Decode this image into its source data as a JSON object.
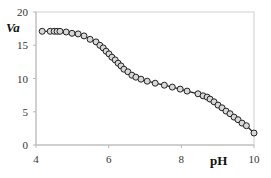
{
  "chart_data": {
    "type": "line",
    "title": "",
    "xlabel": "pH",
    "ylabel": "Va",
    "xlim": [
      4,
      10
    ],
    "ylim": [
      0,
      20
    ],
    "xticks": [
      4,
      6,
      8,
      10
    ],
    "yticks": [
      0,
      5,
      10,
      15,
      20
    ],
    "grid": false,
    "legend": null,
    "marker": "open-circle",
    "series": [
      {
        "name": "Va",
        "color": "#222222",
        "x": [
          4.17,
          4.39,
          4.5,
          4.58,
          4.66,
          4.83,
          4.99,
          5.16,
          5.32,
          5.49,
          5.65,
          5.76,
          5.85,
          5.93,
          6.01,
          6.09,
          6.18,
          6.26,
          6.34,
          6.42,
          6.53,
          6.64,
          6.75,
          6.89,
          7.06,
          7.28,
          7.53,
          7.75,
          7.97,
          8.16,
          8.46,
          8.6,
          8.71,
          8.79,
          8.9,
          9.01,
          9.12,
          9.23,
          9.34,
          9.45,
          9.56,
          9.67,
          9.79,
          10.0
        ],
        "y": [
          17.1,
          17.1,
          17.1,
          17.1,
          17.1,
          17.0,
          16.8,
          16.7,
          16.4,
          15.9,
          15.5,
          15.0,
          14.6,
          14.1,
          13.7,
          13.2,
          12.8,
          12.3,
          11.9,
          11.4,
          11.0,
          10.5,
          10.2,
          9.9,
          9.6,
          9.3,
          9.0,
          8.7,
          8.4,
          8.1,
          7.7,
          7.4,
          7.2,
          6.9,
          6.5,
          6.0,
          5.6,
          5.1,
          4.7,
          4.2,
          3.8,
          3.3,
          2.9,
          1.8
        ]
      }
    ]
  }
}
